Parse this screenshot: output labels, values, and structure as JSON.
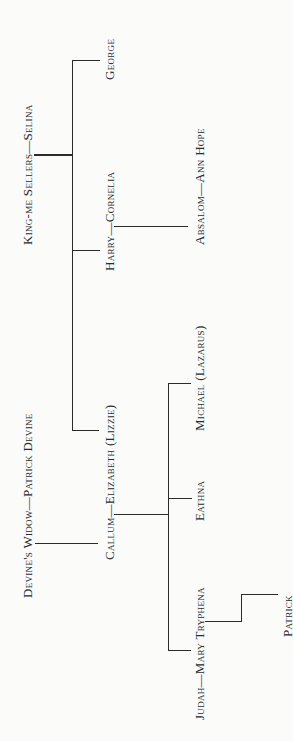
{
  "diagram": {
    "type": "family-tree",
    "orientation": "rotated-90-ccw",
    "line_color": "#2b2b2b",
    "background": "#fbfbf9",
    "nodes": {
      "king_me_sellers_selina": "King-me Sellers—Selina",
      "george": "George",
      "harry_cornelia": "Harry—Cornelia",
      "absalom_ann_hope": "Absalom—Ann Hope",
      "devines_widow_patrick_devine": "Devine's Widow—Patrick Devine",
      "callum_elizabeth": "Callum—Elizabeth (Lizzie)",
      "michael": "Michael (Lazarus)",
      "eathna": "Eathna",
      "judah_mary_tryphena": "Judah—Mary Tryphena",
      "patrick": "Patrick"
    },
    "relationships": [
      {
        "parents": "King-me Sellers—Selina",
        "children": [
          "George",
          "Harry—Cornelia",
          "Elizabeth (Lizzie)"
        ]
      },
      {
        "parents": "Harry—Cornelia",
        "children": [
          "Absalom—Ann Hope"
        ]
      },
      {
        "parents": "Devine's Widow—Patrick Devine",
        "children": [
          "Callum"
        ]
      },
      {
        "parents": "Callum—Elizabeth (Lizzie)",
        "children": [
          "Michael (Lazarus)",
          "Eathna",
          "Judah—Mary Tryphena"
        ]
      },
      {
        "parents": "Judah—Mary Tryphena",
        "children": [
          "Patrick"
        ]
      }
    ]
  }
}
